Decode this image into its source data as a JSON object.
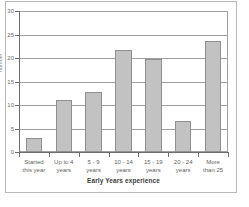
{
  "chart_data": {
    "type": "bar",
    "title": "",
    "xlabel": "Early Years experience",
    "ylabel": "number",
    "categories": [
      "Started\nthis year",
      "Up to 4\nyears",
      "5 - 9\nyears",
      "10 - 14\nyears",
      "15 - 19\nyears",
      "20 - 24\nyears",
      "More\nthan 25"
    ],
    "values": [
      3,
      11,
      12.7,
      21.7,
      19.8,
      6.5,
      23.7
    ],
    "ylim": [
      0,
      30
    ],
    "yticks": [
      0,
      5,
      10,
      15,
      20,
      25,
      30
    ],
    "ytick_labels": [
      "0",
      "5",
      "10",
      "15",
      "20",
      "25",
      "30"
    ],
    "grid": true,
    "legend": "none",
    "bar_color": "#c2c2c2",
    "bar_border_color": "#8f8f8f",
    "axis_color": "#6e6e6e",
    "grid_color": "#9e9e9e",
    "background": "#ffffff"
  }
}
